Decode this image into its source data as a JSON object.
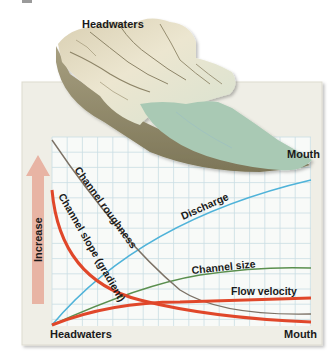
{
  "figure": {
    "title_top": "Headwaters",
    "mouth_top": "Mouth",
    "axis_label_y": "Increase",
    "axis_label_x_left": "Headwaters",
    "axis_label_x_right": "Mouth",
    "colors": {
      "card_bg": "#efeee6",
      "grid_bg": "#f8faf8",
      "grid_line": "#c9dde3",
      "arrow": "#e8b4a4",
      "terrain_light": "#e6e0c8",
      "terrain_dark": "#9a9272",
      "water": "#a9c9b4",
      "discharge": "#4fb3d9",
      "channel_size": "#5a8f4e",
      "flow_velocity": "#e0472a",
      "channel_roughness": "#7c7266",
      "channel_slope": "#e0472a"
    }
  },
  "chart_data": {
    "type": "line",
    "xlabel": "Distance downstream",
    "ylabel": "Increase",
    "x_ticks": [
      "Headwaters",
      "Mouth"
    ],
    "x": [
      0,
      0.1,
      0.2,
      0.3,
      0.4,
      0.5,
      0.6,
      0.7,
      0.8,
      0.9,
      1.0
    ],
    "ylim": [
      0,
      1
    ],
    "grid": true,
    "series": [
      {
        "name": "Discharge",
        "values": [
          0.0,
          0.2,
          0.36,
          0.48,
          0.57,
          0.64,
          0.7,
          0.75,
          0.8,
          0.84,
          0.88
        ]
      },
      {
        "name": "Channel size",
        "values": [
          0.0,
          0.11,
          0.19,
          0.25,
          0.29,
          0.32,
          0.34,
          0.35,
          0.36,
          0.36,
          0.36
        ]
      },
      {
        "name": "Flow velocity",
        "values": [
          0.0,
          0.06,
          0.09,
          0.11,
          0.12,
          0.13,
          0.14,
          0.15,
          0.15,
          0.16,
          0.16
        ]
      },
      {
        "name": "Channel roughness",
        "values": [
          1.0,
          0.85,
          0.7,
          0.55,
          0.4,
          0.28,
          0.18,
          0.12,
          0.09,
          0.08,
          0.07
        ]
      },
      {
        "name": "Channel slope (gradient)",
        "values": [
          0.78,
          0.45,
          0.24,
          0.14,
          0.09,
          0.07,
          0.05,
          0.04,
          0.03,
          0.03,
          0.02
        ]
      }
    ],
    "annotations": [
      "Headwaters",
      "Mouth",
      "Increase"
    ]
  }
}
